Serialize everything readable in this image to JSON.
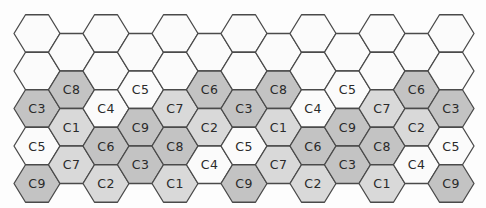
{
  "diagram": {
    "type": "hexagonal-grid",
    "orientation": "flat-top",
    "columns": 13,
    "shades": {
      "dark": "#c3c3c3",
      "light": "#d9d9d9",
      "white": "#fbfbfb"
    },
    "label_shade": {
      "C1": "light",
      "C2": "light",
      "C3": "dark",
      "C4": "white",
      "C5": "white",
      "C6": "dark",
      "C7": "light",
      "C8": "dark",
      "C9": "dark"
    },
    "column_cells": [
      [
        "",
        "",
        "C3",
        "C5",
        "C9"
      ],
      [
        "",
        "C8",
        "C1",
        "C7"
      ],
      [
        "",
        "",
        "C4",
        "C6",
        "C2"
      ],
      [
        "",
        "C5",
        "C9",
        "C3"
      ],
      [
        "",
        "",
        "C7",
        "C8",
        "C1"
      ],
      [
        "",
        "C6",
        "C2",
        "C4"
      ],
      [
        "",
        "",
        "C3",
        "C5",
        "C9"
      ],
      [
        "",
        "C8",
        "C1",
        "C7"
      ],
      [
        "",
        "",
        "C4",
        "C6",
        "C2"
      ],
      [
        "",
        "C5",
        "C9",
        "C3"
      ],
      [
        "",
        "",
        "C7",
        "C8",
        "C1"
      ],
      [
        "",
        "C6",
        "C2",
        "C4"
      ],
      [
        "",
        "",
        "C3",
        "C5",
        "C9"
      ]
    ]
  }
}
